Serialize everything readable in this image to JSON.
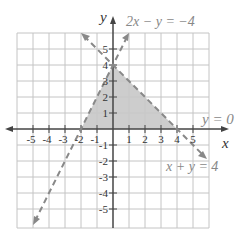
{
  "graph": {
    "x_axis_label": "x",
    "y_axis_label": "y",
    "x_ticks": [
      "-5",
      "-4",
      "-3",
      "-2",
      "-1",
      "1",
      "2",
      "3",
      "4",
      "5"
    ],
    "y_ticks": [
      "5",
      "4",
      "3",
      "2",
      "1",
      "-1",
      "-2",
      "-3",
      "-4",
      "-5"
    ],
    "lines": [
      {
        "equation": "2x − y = −4",
        "style": "dashed"
      },
      {
        "equation": "x + y = 4",
        "style": "dashed"
      },
      {
        "equation": "y = 0",
        "style": "solid-axis"
      }
    ],
    "shaded_region": "triangle with vertices (-2,0), (0,4), (4,0)",
    "colors": {
      "grid": "#bfbfbf",
      "axis": "#444444",
      "boundary": "#888888",
      "shade": "#cccccc"
    }
  }
}
